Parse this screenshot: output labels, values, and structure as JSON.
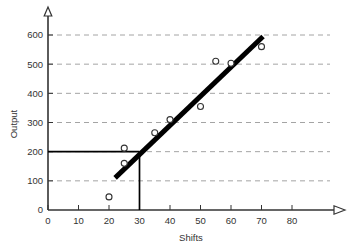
{
  "chart_data": {
    "type": "scatter",
    "title": "",
    "xlabel": "Shifts",
    "ylabel": "Output",
    "xlim": [
      0,
      85
    ],
    "ylim": [
      0,
      620
    ],
    "xticks": [
      0,
      10,
      20,
      30,
      40,
      50,
      60,
      70,
      80
    ],
    "yticks": [
      0,
      100,
      200,
      300,
      400,
      500,
      600
    ],
    "xtick_labels": [
      "0",
      "10",
      "20",
      "30",
      "40",
      "50",
      "60",
      "70",
      "80"
    ],
    "ytick_labels": [
      "0",
      "100",
      "200",
      "300",
      "400",
      "500",
      "600"
    ],
    "grid": "horizontal-dashed",
    "legend": "none",
    "points": [
      {
        "x": 20,
        "y": 45
      },
      {
        "x": 25,
        "y": 160
      },
      {
        "x": 25,
        "y": 212
      },
      {
        "x": 35,
        "y": 265
      },
      {
        "x": 40,
        "y": 310
      },
      {
        "x": 50,
        "y": 355
      },
      {
        "x": 55,
        "y": 510
      },
      {
        "x": 60,
        "y": 503
      },
      {
        "x": 70,
        "y": 560
      }
    ],
    "trend_line": {
      "label": "fitted-regression-line",
      "x_start": 22,
      "y_start": 110,
      "x_end": 70.5,
      "y_end": 595
    },
    "reference_lines": [
      {
        "label": "horizontal-reference-at-200",
        "orientation": "horizontal",
        "value": 200,
        "from": 0,
        "to": 30
      },
      {
        "label": "vertical-reference-at-30",
        "orientation": "vertical",
        "value": 30,
        "from": 0,
        "to": 200
      }
    ],
    "colors": {
      "axis": "#333333",
      "grid": "#9a9a9a",
      "trend_line": "#000000",
      "reference_line": "#000000",
      "marker_stroke": "#333333",
      "marker_fill": "#ffffff",
      "background": "#ffffff"
    }
  }
}
